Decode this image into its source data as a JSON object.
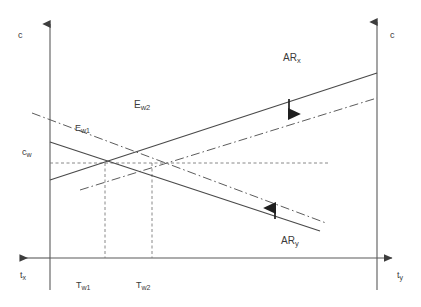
{
  "figure": {
    "type": "economic-diagram",
    "background_color": "#ffffff",
    "line_color": "#4a4a4a",
    "text_color": "#3a3a3a"
  },
  "axes": {
    "left_vertical": {
      "label": "c",
      "name": "left-c-axis",
      "x": 50,
      "y_top": 20,
      "y_bottom": 290,
      "arrow": "up",
      "label_x": 20,
      "label_y": 33
    },
    "right_vertical": {
      "label": "c",
      "name": "right-c-axis",
      "x": 377,
      "y_top": 18,
      "y_bottom": 290,
      "arrow": "up",
      "label_x": 391,
      "label_y": 33
    },
    "horizontal": {
      "y": 258,
      "x_left": 18,
      "x_right": 394,
      "arrow_left_label": "t_x",
      "arrow_right_label": "t_y",
      "left_label": "t",
      "left_sub": "x",
      "right_label": "t",
      "right_sub": "y",
      "left_label_x": 21,
      "left_label_y": 276,
      "right_label_x": 398,
      "right_label_y": 276
    }
  },
  "curves": [
    {
      "name": "ar-x-solid",
      "style": "solid",
      "direction": "rising",
      "x1": 50,
      "y1": 180,
      "x2": 377,
      "y2": 73
    },
    {
      "name": "ar-x-shifted-dashdot",
      "style": "dashdot",
      "direction": "rising",
      "x1": 80,
      "y1": 190,
      "x2": 377,
      "y2": 98
    },
    {
      "name": "ar-y-solid",
      "style": "solid",
      "direction": "falling",
      "x1": 50,
      "y1": 142,
      "x2": 320,
      "y2": 231
    },
    {
      "name": "ar-y-shifted-dashdot",
      "style": "dashdot",
      "direction": "falling",
      "x1": 32,
      "y1": 113,
      "x2": 326,
      "y2": 223
    }
  ],
  "guides": [
    {
      "name": "cw-horizontal-guide",
      "style": "dashed",
      "x1": 50,
      "y1": 163,
      "x2": 330,
      "y2": 163
    },
    {
      "name": "tw1-vertical-guide",
      "style": "dashed",
      "x1": 105,
      "y1": 163,
      "x2": 105,
      "y2": 258
    },
    {
      "name": "tw2-vertical-guide",
      "style": "dashed",
      "x1": 152,
      "y1": 163,
      "x2": 152,
      "y2": 258
    }
  ],
  "shift_arrows": [
    {
      "name": "ar-x-down-shift-arrow",
      "direction": "down",
      "x": 289,
      "y_start": 100,
      "y_end": 120
    },
    {
      "name": "ar-y-up-shift-arrow",
      "direction": "up",
      "x": 275,
      "y_start": 219,
      "y_end": 202
    }
  ],
  "labels": {
    "c_left": {
      "text": "c",
      "x": 20,
      "y": 33
    },
    "c_right": {
      "text": "c",
      "x": 391,
      "y": 33
    },
    "t_x": {
      "base": "t",
      "sub": "x",
      "x": 21,
      "y": 276
    },
    "t_y": {
      "base": "t",
      "sub": "y",
      "x": 398,
      "y": 276
    },
    "c_w": {
      "base": "c",
      "sub": "w",
      "x": 23,
      "y": 150
    },
    "T_w1": {
      "base": "T",
      "sub": "w1",
      "x": 78,
      "y": 283
    },
    "T_w2": {
      "base": "T",
      "sub": "w2",
      "x": 138,
      "y": 283
    },
    "E_w1": {
      "base": "E",
      "sub": "w1",
      "x": 76,
      "y": 125
    },
    "E_w2": {
      "base": "E",
      "sub": "w2",
      "x": 136,
      "y": 103
    },
    "AR_x": {
      "base": "AR",
      "sub": "x",
      "x": 284,
      "y": 55
    },
    "AR_y": {
      "base": "AR",
      "sub": "y",
      "x": 282,
      "y": 238
    }
  },
  "equilibria": [
    {
      "name": "E_w1",
      "x": 105,
      "y": 163,
      "tax": "T_w1",
      "cost": "c_w"
    },
    {
      "name": "E_w2",
      "x": 152,
      "y": 163,
      "tax": "T_w2",
      "cost": "c_w"
    }
  ]
}
